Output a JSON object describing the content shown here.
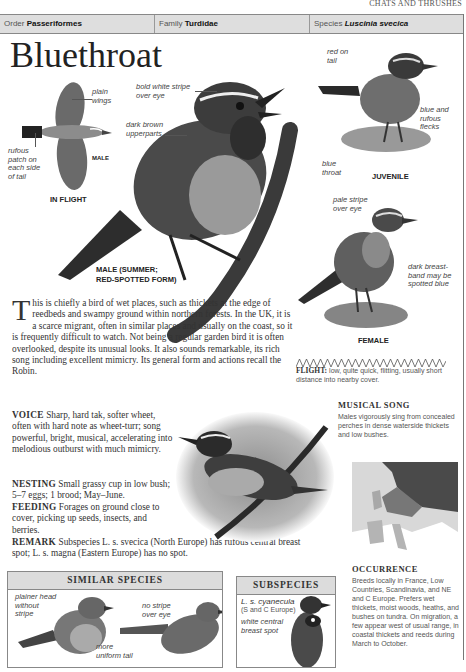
{
  "running_head": "CHATS AND THRUSHES",
  "taxonomy": {
    "order_label": "Order",
    "order_value": "Passeriformes",
    "family_label": "Family",
    "family_value": "Turdidae",
    "species_label": "Species",
    "species_value": "Luscinia svecica"
  },
  "title": "Bluethroat",
  "illustrations": {
    "in_flight": {
      "caption": "IN FLIGHT",
      "sex": "MALE",
      "labels": [
        "plain wings",
        "rufous patch on each side of tail"
      ]
    },
    "male_summer": {
      "caption_line1": "MALE (SUMMER;",
      "caption_line2": "RED-SPOTTED FORM)",
      "labels": [
        "bold white stripe over eye",
        "dark brown upperparts",
        "blue throat"
      ]
    },
    "juvenile": {
      "caption": "JUVENILE",
      "labels": [
        "red on tail",
        "blue and rufous flecks"
      ]
    },
    "female": {
      "caption": "FEMALE",
      "labels": [
        "pale stripe over eye",
        "dark breast-band may be spotted blue"
      ]
    }
  },
  "intro": {
    "dropcap": "T",
    "text": "his is chiefly a bird of wet places, such as thickets at the edge of reedbeds and swampy ground within northern forests. In the UK, it is a scarce migrant, often in similar places and usually on the coast, so it is frequently difficult to watch. Not being a regular garden bird it is often overlooked, despite its unusual looks. It also sounds remarkable, its rich song including excellent mimicry. Its general form and actions recall the Robin."
  },
  "sections": [
    {
      "heading": "VOICE",
      "text": "Sharp, hard tak, softer wheet, often with hard note as wheet-turr; song powerful, bright, musical, accelerating into melodious outburst with much mimicry."
    },
    {
      "heading": "NESTING",
      "text": "Small grassy cup in low bush; 5–7 eggs; 1 brood; May–June."
    },
    {
      "heading": "FEEDING",
      "text": "Forages on ground close to cover, picking up seeds, insects, and berries."
    },
    {
      "heading": "REMARK",
      "text": "Subspecies L. s. svecica (North Europe) has rufous central breast spot; L. s. magna (Eastern Europe) has no spot."
    }
  ],
  "flight": {
    "heading": "FLIGHT:",
    "text": "low, quite quick, flitting, usually short distance into nearby cover."
  },
  "musical_song": {
    "heading": "MUSICAL SONG",
    "text": "Males vigorously sing from concealed perches in dense waterside thickets and low bushes."
  },
  "occurrence": {
    "heading": "OCCURRENCE",
    "text": "Breeds locally in France, Low Countries, Scandinavia, and NE and C Europe. Prefers wet thickets, moist woods, heaths, and bushes on tundra. On migration, a few appear west of usual range, in coastal thickets and reeds during March to October."
  },
  "similar_species": {
    "heading": "SIMILAR SPECIES",
    "labels": [
      "plainer head without stripe",
      "no stripe over eye",
      "more uniform tail"
    ]
  },
  "subspecies": {
    "heading": "SUBSPECIES",
    "name": "L. s. cyanecula",
    "region": "(S and C Europe)",
    "label": "white central breast spot"
  },
  "colors": {
    "header_bg": "#dedede",
    "panel_head_bg": "#dcdcdc",
    "border": "#888888",
    "text": "#333333"
  }
}
